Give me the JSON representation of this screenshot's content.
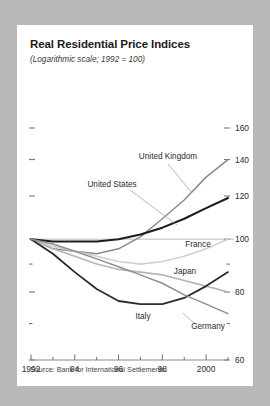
{
  "card": {
    "title": "Real Residential Price Indices",
    "subtitle": "(Logarithmic scale; 1992 = 100)",
    "source": "Source: Bank for International Settlements."
  },
  "chart_data": {
    "type": "line",
    "title": "Real Residential Price Indices",
    "subtitle": "(Logarithmic scale; 1992 = 100)",
    "xlabel": "",
    "ylabel": "",
    "scale": "logarithmic",
    "base_year": 1992,
    "base_value": 100,
    "grid": false,
    "legend": "inline-annotations",
    "xlim": [
      1992,
      2001
    ],
    "ylim": [
      60,
      160
    ],
    "x_major_ticks": [
      1992,
      1994,
      1996,
      1998,
      2000
    ],
    "x_major_tick_labels": [
      "1992",
      "94",
      "96",
      "98",
      "2000"
    ],
    "x_minor_ticks": [
      1993,
      1995,
      1997,
      1999,
      2001
    ],
    "y_ticks": [
      60,
      70,
      80,
      90,
      100,
      120,
      140,
      160
    ],
    "y_tick_labels": [
      "60",
      "",
      "80",
      "",
      "100",
      "120",
      "140",
      "160"
    ],
    "x": [
      1992,
      1993,
      1994,
      1995,
      1996,
      1997,
      1998,
      1999,
      2000,
      2001
    ],
    "series": [
      {
        "name": "United Kingdom",
        "color": "#8a8a8a",
        "width": 1.5,
        "values": [
          100,
          96,
          95,
          94,
          96,
          101,
          109,
          118,
          130,
          140
        ],
        "label_x": 151,
        "label_y": 134,
        "label_anchor": "middle",
        "leader": "M 151,139 L 175,168"
      },
      {
        "name": "United States",
        "color": "#1c1c1c",
        "width": 2.1,
        "values": [
          100,
          99,
          99,
          99,
          100,
          102,
          105,
          109,
          114,
          119
        ],
        "label_x": 95,
        "label_y": 162,
        "label_anchor": "middle",
        "leader": "M 113,165 L 160,200"
      },
      {
        "name": "France",
        "color": "#d0d0d0",
        "width": 1.6,
        "values": [
          100,
          97,
          95,
          93,
          91,
          90,
          91,
          93,
          96,
          100
        ],
        "label_x": 181,
        "label_y": 222,
        "label_anchor": "middle",
        "leader": ""
      },
      {
        "name": "Japan",
        "color": "#b5b5b5",
        "width": 1.6,
        "values": [
          100,
          96,
          93,
          90,
          88,
          87,
          86,
          84,
          82,
          80
        ],
        "label_x": 168,
        "label_y": 249,
        "label_anchor": "middle",
        "leader": ""
      },
      {
        "name": "Italy",
        "color": "#2b2b2b",
        "width": 1.8,
        "values": [
          100,
          94,
          87,
          81,
          77,
          76,
          76,
          78,
          82,
          87
        ],
        "label_x": 126,
        "label_y": 294,
        "label_anchor": "middle",
        "leader": ""
      },
      {
        "name": "Germany",
        "color": "#8f8f8f",
        "width": 1.5,
        "values": [
          100,
          98,
          95,
          92,
          89,
          86,
          83,
          79,
          76,
          73
        ],
        "label_x": 191,
        "label_y": 304,
        "label_anchor": "middle",
        "leader": "M 178,299 L 166,288"
      }
    ]
  }
}
